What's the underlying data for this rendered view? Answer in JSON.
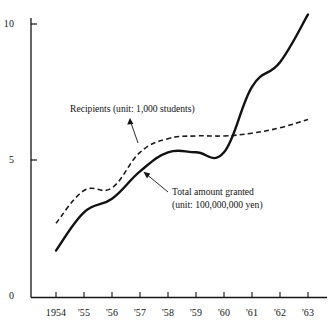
{
  "chart_data": {
    "type": "line",
    "title": "",
    "xlabel": "",
    "ylabel": "",
    "x": [
      1954,
      1955,
      1956,
      1957,
      1958,
      1959,
      1960,
      1961,
      1962,
      1963
    ],
    "categories": [
      "1954",
      "'55",
      "'56",
      "'57",
      "'58",
      "'59",
      "'60",
      "'61",
      "'62",
      "'63"
    ],
    "xlim": [
      1954,
      1963
    ],
    "ylim": [
      0,
      10.8
    ],
    "yticks": [
      0,
      5,
      10
    ],
    "ytick_labels": [
      "0",
      "5",
      "10"
    ],
    "grid": false,
    "legend": "inline-annotations",
    "series": [
      {
        "name": "Recipients (unit: 1,000 students)",
        "style": "dashed",
        "color": "#1a1a1a",
        "values": [
          2.7,
          3.9,
          4.0,
          5.3,
          5.8,
          5.9,
          5.9,
          6.0,
          6.2,
          6.5
        ]
      },
      {
        "name": "Total amount granted (unit: 100,000,000 yen)",
        "style": "solid",
        "color": "#111111",
        "values": [
          1.7,
          3.1,
          3.6,
          4.6,
          5.3,
          5.3,
          5.3,
          7.7,
          8.6,
          10.35
        ]
      }
    ],
    "annotations": [
      {
        "id": "recipients-label",
        "lines": [
          "Recipients (unit: 1,000 students)"
        ],
        "arrow": "up-arrow pointing to dashed line"
      },
      {
        "id": "total-amount-label",
        "lines": [
          "Total amount granted",
          "(unit: 100,000,000 yen)"
        ],
        "arrow": "arrow pointing down-left to solid line"
      }
    ]
  },
  "axis": {
    "y_tick_10": "10",
    "y_tick_5": "5",
    "y_tick_0": "0",
    "x_ticks": [
      "1954",
      "'55",
      "'56",
      "'57",
      "'58",
      "'59",
      "'60",
      "'61",
      "'62",
      "'63"
    ]
  },
  "annotations": {
    "recipients": "Recipients (unit: 1,000 students)",
    "total_line1": "Total amount granted",
    "total_line2": "(unit: 100,000,000 yen)"
  },
  "colors": {
    "ink": "#141414",
    "background": "#ffffff"
  }
}
